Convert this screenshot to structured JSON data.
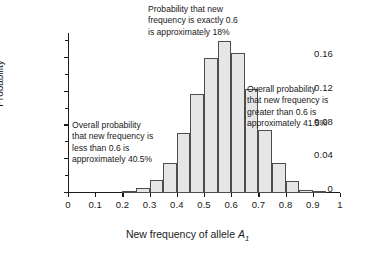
{
  "chart_data": {
    "type": "bar",
    "title": "",
    "xlabel": "New frequency of allele A1",
    "ylabel": "Probability",
    "xlim": [
      0,
      1
    ],
    "ylim": [
      0,
      0.19
    ],
    "grid": false,
    "legend": "none",
    "bin_width": 0.05,
    "xticks": [
      "0",
      "0.1",
      "0.2",
      "0.3",
      "0.4",
      "0.5",
      "0.6",
      "0.7",
      "0.8",
      "0.9",
      "1"
    ],
    "xtick_values": [
      0,
      0.1,
      0.2,
      0.3,
      0.4,
      0.5,
      0.6,
      0.7,
      0.8,
      0.9,
      1
    ],
    "yticks": [
      "0",
      "0.04",
      "0.08",
      "0.12",
      "0.16"
    ],
    "ytick_values": [
      0,
      0.04,
      0.08,
      0.12,
      0.16
    ],
    "yticks_minor": [
      0.02,
      0.06,
      0.1,
      0.14,
      0.18
    ],
    "bin_centers": [
      0.225,
      0.275,
      0.325,
      0.375,
      0.425,
      0.475,
      0.525,
      0.575,
      0.625,
      0.675,
      0.725,
      0.775,
      0.825,
      0.875,
      0.925
    ],
    "categories": [
      "0.20-0.25",
      "0.25-0.30",
      "0.30-0.35",
      "0.35-0.40",
      "0.40-0.45",
      "0.45-0.50",
      "0.50-0.55",
      "0.55-0.60",
      "0.60-0.65",
      "0.65-0.70",
      "0.70-0.75",
      "0.75-0.80",
      "0.80-0.85",
      "0.85-0.90",
      "0.90-0.95"
    ],
    "values": [
      0.002,
      0.006,
      0.016,
      0.036,
      0.071,
      0.118,
      0.16,
      0.18,
      0.166,
      0.124,
      0.075,
      0.036,
      0.014,
      0.004,
      0.001
    ],
    "bar_fill": "#e6e6e6",
    "bar_stroke": "#4d4d4d"
  },
  "annotations": {
    "top": "Probability that new\nfrequency is exactly 0.6\nis approximately 18%",
    "left": "Overall probability\nthat new frequency is\nless than 0.6 is\napproximately 40.5%",
    "right": "Overall probability\nthat new frequency is\ngreater than 0.6 is\napproximately 41.5%"
  },
  "axis_labels": {
    "y": "Probability",
    "x_prefix": "New frequency of allele ",
    "x_italic": "A",
    "x_subscript": "1"
  }
}
